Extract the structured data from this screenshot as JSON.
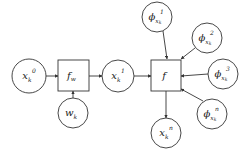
{
  "diagram": {
    "colors": {
      "stroke": "#333333",
      "background": "#ffffff",
      "text": "#222222"
    },
    "nodes": [
      {
        "id": "x0",
        "shape": "circle",
        "cx": 29,
        "cy": 76,
        "r": 17,
        "base": "x",
        "sub": "k",
        "sup": "0"
      },
      {
        "id": "fw",
        "shape": "box",
        "x": 58,
        "y": 60,
        "w": 31,
        "h": 31,
        "base": "f",
        "sub": "w",
        "sup": ""
      },
      {
        "id": "wk",
        "shape": "circle",
        "cx": 73,
        "cy": 113,
        "r": 15,
        "base": "w",
        "sub": "k",
        "sup": ""
      },
      {
        "id": "x1",
        "shape": "circle",
        "cx": 118,
        "cy": 76,
        "r": 16,
        "base": "x",
        "sub": "k",
        "sup": "1"
      },
      {
        "id": "f",
        "shape": "box",
        "x": 151,
        "y": 60,
        "w": 30,
        "h": 31,
        "base": "f",
        "sub": "",
        "sup": ""
      },
      {
        "id": "xn",
        "shape": "circle",
        "cx": 166,
        "cy": 133,
        "r": 15,
        "base": "x",
        "sub": "k",
        "sup": "n"
      },
      {
        "id": "phi1",
        "shape": "circle",
        "cx": 157,
        "cy": 17,
        "r": 15,
        "base": "ϕ",
        "sub": "x",
        "subsub": "k",
        "sup": "1"
      },
      {
        "id": "phi2",
        "shape": "circle",
        "cx": 207,
        "cy": 38,
        "r": 15,
        "base": "ϕ",
        "sub": "x",
        "subsub": "k",
        "sup": "2"
      },
      {
        "id": "phi3",
        "shape": "circle",
        "cx": 223,
        "cy": 74,
        "r": 15,
        "base": "ϕ",
        "sub": "x",
        "subsub": "k",
        "sup": "3"
      },
      {
        "id": "phin",
        "shape": "circle",
        "cx": 212,
        "cy": 114,
        "r": 15,
        "base": "ϕ",
        "sub": "x",
        "subsub": "k",
        "sup": "n"
      }
    ],
    "edges": [
      {
        "from": "x0",
        "to": "fw",
        "x1": 46,
        "y1": 76,
        "x2": 58,
        "y2": 76
      },
      {
        "from": "wk",
        "to": "fw",
        "x1": 73,
        "y1": 98,
        "x2": 73,
        "y2": 91
      },
      {
        "from": "fw",
        "to": "x1",
        "x1": 89,
        "y1": 76,
        "x2": 102,
        "y2": 76
      },
      {
        "from": "x1",
        "to": "f",
        "x1": 134,
        "y1": 76,
        "x2": 151,
        "y2": 76
      },
      {
        "from": "f",
        "to": "xn",
        "x1": 166,
        "y1": 91,
        "x2": 166,
        "y2": 118
      },
      {
        "from": "phi1",
        "to": "f",
        "x1": 163,
        "y1": 31,
        "x2": 167,
        "y2": 59
      },
      {
        "from": "phi2",
        "to": "f",
        "x1": 195,
        "y1": 48,
        "x2": 181,
        "y2": 59
      },
      {
        "from": "phi3",
        "to": "f",
        "x1": 208,
        "y1": 74,
        "x2": 181,
        "y2": 76
      },
      {
        "from": "phin",
        "to": "f",
        "x1": 203,
        "y1": 101,
        "x2": 181,
        "y2": 89
      }
    ]
  }
}
